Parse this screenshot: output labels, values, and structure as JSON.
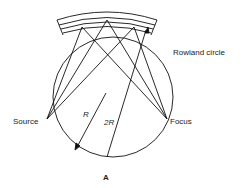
{
  "diagram": {
    "labels": {
      "rowland": "Rowland circle",
      "source": "Source",
      "focus": "Focus",
      "radius": "R",
      "two_radius": "2R",
      "panel": "A"
    }
  }
}
